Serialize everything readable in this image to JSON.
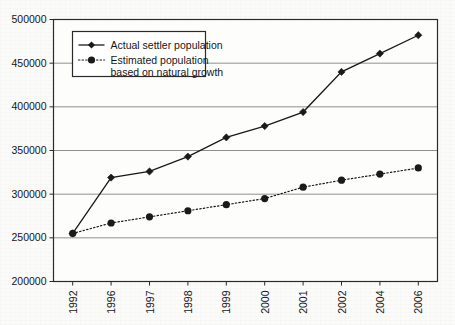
{
  "chart_data": {
    "type": "line",
    "title": "",
    "subtitle": "",
    "xlabel": "",
    "ylabel": "",
    "categories": [
      "1992",
      "1996",
      "1997",
      "1998",
      "1999",
      "2000",
      "2001",
      "2002",
      "2004",
      "2006"
    ],
    "ylim": [
      200000,
      500000
    ],
    "ytick_values": [
      200000,
      250000,
      300000,
      350000,
      400000,
      450000,
      500000
    ],
    "ytick_labels": [
      "200000",
      "250000",
      "300000",
      "350000",
      "400000",
      "450000",
      "500000"
    ],
    "grid": "horizontal",
    "legend_position": "top-left-inside",
    "series": [
      {
        "name": "Actual settler population",
        "marker": "diamond",
        "line_style": "solid",
        "color": "#1a1a1a",
        "values": [
          255000,
          319000,
          326000,
          343000,
          365000,
          378000,
          394000,
          440000,
          461000,
          482000
        ]
      },
      {
        "name": "Estimated population based on natural growth",
        "marker": "circle",
        "line_style": "dotted",
        "color": "#1a1a1a",
        "values": [
          255000,
          267000,
          274000,
          281000,
          288000,
          295000,
          308000,
          316000,
          323000,
          330000
        ]
      }
    ]
  },
  "legend": {
    "entries": [
      {
        "label": "Actual settler population",
        "line2": ""
      },
      {
        "label": "Estimated population",
        "line2": "based on natural growth"
      }
    ]
  },
  "axes": {
    "y_labels": [
      "500000",
      "450000",
      "400000",
      "350000",
      "300000",
      "250000",
      "200000"
    ],
    "x_labels": [
      "1992",
      "1996",
      "1997",
      "1998",
      "1999",
      "2000",
      "2001",
      "2002",
      "2004",
      "2006"
    ]
  },
  "colors": {
    "ink": "#1a1a1a",
    "gridline": "#8f8f8f",
    "axis": "#2a2a2a",
    "background": "#fbfbfa"
  }
}
